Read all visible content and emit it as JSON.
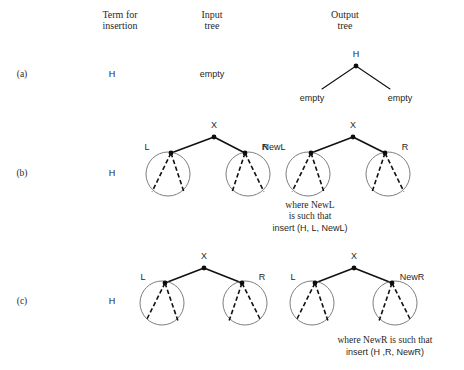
{
  "figure": {
    "width": 464,
    "height": 370,
    "background": "#ffffff",
    "ink": "#111111",
    "circle_stroke": "#6f6f6f"
  },
  "headers": [
    {
      "name": "term-header",
      "line1": "Term for",
      "line2": "insertion",
      "cx": 120,
      "y1": 18,
      "y2": 29
    },
    {
      "name": "input-header",
      "line1": "Input",
      "line2": "tree",
      "cx": 212,
      "y1": 18,
      "y2": 29
    },
    {
      "name": "output-header",
      "line1": "Output",
      "line2": "tree",
      "cx": 345,
      "y1": 18,
      "y2": 29
    }
  ],
  "rows": [
    {
      "id": "a",
      "label": "(a)",
      "label_x": 22,
      "label_y": 77,
      "term": "H",
      "term_x": 112,
      "term_y": 77,
      "input_kind": "empty-text",
      "input_text": "empty",
      "input_x": 212,
      "input_y": 77,
      "output_kind": "leaf-tree",
      "root_label": "H",
      "left_label": "empty",
      "right_label": "empty",
      "root_x": 356,
      "root_y": 66,
      "root_label_y": 57,
      "left_leaf_x": 312,
      "right_leaf_x": 400,
      "leaf_y": 98,
      "leaf_text_y": 101
    },
    {
      "id": "b",
      "label": "(b)",
      "label_x": 22,
      "label_y": 176,
      "term": "H",
      "term_x": 112,
      "term_y": 176,
      "input_kind": "subtree-tree",
      "output_kind": "subtree-tree",
      "input_tree": {
        "name": "input-tree-b",
        "root_x": 214,
        "root_y": 137,
        "root_label": "X",
        "root_label_y": 128,
        "left": {
          "label": "L",
          "cx": 168,
          "cy": 174,
          "r": 22,
          "apex_x": 171,
          "apex_y": 153,
          "label_x": 147,
          "label_y": 150
        },
        "right": {
          "label": "R",
          "cx": 248,
          "cy": 174,
          "r": 22,
          "apex_x": 245,
          "apex_y": 153,
          "label_x": 265,
          "label_y": 150
        }
      },
      "output_tree": {
        "name": "output-tree-b",
        "root_x": 353,
        "root_y": 137,
        "root_label": "X",
        "root_label_y": 128,
        "left": {
          "label": "NewL",
          "cx": 308,
          "cy": 174,
          "r": 22,
          "apex_x": 311,
          "apex_y": 153,
          "label_x": 274,
          "label_y": 150
        },
        "right": {
          "label": "R",
          "cx": 388,
          "cy": 174,
          "r": 22,
          "apex_x": 385,
          "apex_y": 153,
          "label_x": 405,
          "label_y": 150
        }
      },
      "caption": {
        "name": "caption-b",
        "cx": 310,
        "lines": [
          {
            "text": "where NewL",
            "y": 208,
            "style": "serif"
          },
          {
            "text": "is such that",
            "y": 219,
            "style": "serif"
          },
          {
            "text": "insert (H, L, NewL)",
            "y": 231,
            "style": "sans"
          }
        ]
      }
    },
    {
      "id": "c",
      "label": "(c)",
      "label_x": 22,
      "label_y": 304,
      "term": "H",
      "term_x": 112,
      "term_y": 304,
      "input_kind": "subtree-tree",
      "output_kind": "subtree-tree",
      "input_tree": {
        "name": "input-tree-c",
        "root_x": 204,
        "root_y": 268,
        "root_label": "X",
        "root_label_y": 259,
        "left": {
          "label": "L",
          "cx": 162,
          "cy": 303,
          "r": 22,
          "apex_x": 165,
          "apex_y": 283,
          "label_x": 143,
          "label_y": 280
        },
        "right": {
          "label": "R",
          "cx": 245,
          "cy": 303,
          "r": 22,
          "apex_x": 242,
          "apex_y": 283,
          "label_x": 262,
          "label_y": 280
        }
      },
      "output_tree": {
        "name": "output-tree-c",
        "root_x": 354,
        "root_y": 268,
        "root_label": "X",
        "root_label_y": 259,
        "left": {
          "label": "L",
          "cx": 312,
          "cy": 303,
          "r": 22,
          "apex_x": 315,
          "apex_y": 283,
          "label_x": 293,
          "label_y": 280
        },
        "right": {
          "label": "NewR",
          "cx": 395,
          "cy": 303,
          "r": 22,
          "apex_x": 392,
          "apex_y": 283,
          "label_x": 412,
          "label_y": 280
        }
      },
      "caption": {
        "name": "caption-c",
        "cx": 385,
        "lines": [
          {
            "text": "where NewR is such that",
            "y": 343,
            "style": "serif"
          },
          {
            "text": "insert (H ,R, NewR)",
            "y": 355,
            "style": "sans"
          }
        ]
      }
    }
  ]
}
